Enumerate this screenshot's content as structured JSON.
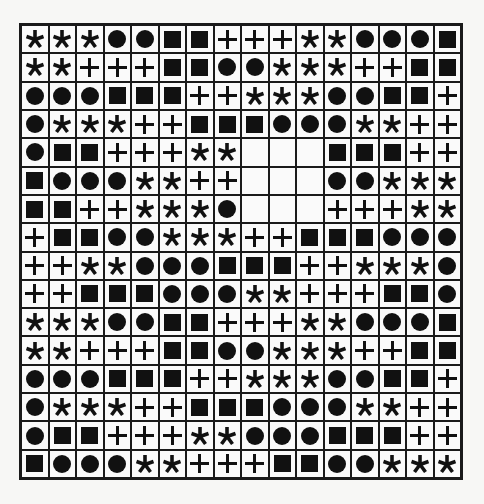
{
  "puzzle": {
    "rows": 16,
    "cols": 16,
    "legend": {
      "S": "asterisk",
      "C": "circle",
      "Q": "square",
      "P": "plus",
      "_": "empty"
    },
    "grid": [
      [
        "S",
        "S",
        "S",
        "C",
        "C",
        "Q",
        "Q",
        "P",
        "P",
        "P",
        "S",
        "S",
        "C",
        "C",
        "C",
        "Q"
      ],
      [
        "S",
        "S",
        "P",
        "P",
        "P",
        "Q",
        "Q",
        "C",
        "C",
        "S",
        "S",
        "S",
        "P",
        "P",
        "Q",
        "Q"
      ],
      [
        "C",
        "C",
        "C",
        "Q",
        "Q",
        "Q",
        "P",
        "P",
        "S",
        "S",
        "S",
        "C",
        "C",
        "Q",
        "Q",
        "P"
      ],
      [
        "C",
        "S",
        "S",
        "S",
        "P",
        "P",
        "Q",
        "Q",
        "Q",
        "C",
        "C",
        "C",
        "S",
        "S",
        "P",
        "P"
      ],
      [
        "C",
        "Q",
        "Q",
        "P",
        "P",
        "P",
        "S",
        "S",
        "_",
        "_",
        "_",
        "Q",
        "Q",
        "Q",
        "P",
        "P"
      ],
      [
        "Q",
        "C",
        "C",
        "C",
        "S",
        "S",
        "P",
        "P",
        "_",
        "_",
        "_",
        "C",
        "C",
        "S",
        "S",
        "S"
      ],
      [
        "Q",
        "Q",
        "P",
        "P",
        "S",
        "S",
        "S",
        "C",
        "_",
        "_",
        "_",
        "P",
        "P",
        "P",
        "S",
        "S"
      ],
      [
        "P",
        "Q",
        "Q",
        "C",
        "C",
        "S",
        "S",
        "S",
        "P",
        "P",
        "Q",
        "Q",
        "Q",
        "C",
        "C",
        "C"
      ],
      [
        "P",
        "P",
        "S",
        "S",
        "C",
        "C",
        "C",
        "Q",
        "Q",
        "Q",
        "P",
        "P",
        "S",
        "S",
        "S",
        "C"
      ],
      [
        "P",
        "P",
        "Q",
        "Q",
        "Q",
        "C",
        "C",
        "C",
        "S",
        "S",
        "P",
        "P",
        "P",
        "Q",
        "Q",
        "C"
      ],
      [
        "S",
        "S",
        "S",
        "C",
        "C",
        "Q",
        "Q",
        "P",
        "P",
        "P",
        "S",
        "S",
        "C",
        "C",
        "C",
        "Q"
      ],
      [
        "S",
        "S",
        "P",
        "P",
        "P",
        "Q",
        "Q",
        "C",
        "C",
        "S",
        "S",
        "S",
        "P",
        "P",
        "Q",
        "Q"
      ],
      [
        "C",
        "C",
        "C",
        "Q",
        "Q",
        "Q",
        "P",
        "P",
        "S",
        "S",
        "S",
        "C",
        "C",
        "Q",
        "Q",
        "P"
      ],
      [
        "C",
        "S",
        "S",
        "S",
        "P",
        "P",
        "Q",
        "Q",
        "Q",
        "C",
        "C",
        "C",
        "S",
        "S",
        "P",
        "P"
      ],
      [
        "C",
        "Q",
        "Q",
        "P",
        "P",
        "P",
        "S",
        "S",
        "C",
        "C",
        "C",
        "Q",
        "Q",
        "Q",
        "P",
        "P"
      ],
      [
        "Q",
        "C",
        "C",
        "C",
        "S",
        "S",
        "P",
        "P",
        "P",
        "Q",
        "Q",
        "C",
        "C",
        "S",
        "S",
        "S"
      ]
    ],
    "empty_region": {
      "rows": [
        5,
        6,
        7
      ],
      "cols": [
        9,
        10,
        11
      ]
    },
    "colors": {
      "ink": "#111111",
      "cell_bg": "#fafafa",
      "page_bg": "#f7f7f5",
      "border": "#1a1a1a"
    }
  }
}
